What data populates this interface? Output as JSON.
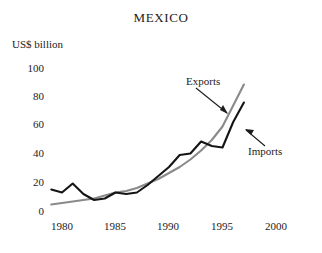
{
  "chart_data": {
    "type": "line",
    "title": "MEXICO",
    "ylabel": "US$ billion",
    "xlabel": "",
    "xlim": [
      1979,
      2001
    ],
    "ylim": [
      0,
      105
    ],
    "grid": false,
    "legend_position": "inline-annotations",
    "yticks": [
      "0",
      "20",
      "40",
      "60",
      "80",
      "100"
    ],
    "ytick_values": [
      0,
      20,
      40,
      60,
      80,
      100
    ],
    "xticks": [
      "1980",
      "1985",
      "1990",
      "1995",
      "2000"
    ],
    "xtick_values": [
      1980,
      1985,
      1990,
      1995,
      2000
    ],
    "series": [
      {
        "name": "Imports",
        "color": "#151515",
        "x": [
          1979,
          1980,
          1981,
          1982,
          1983,
          1984,
          1985,
          1986,
          1987,
          1988,
          1989,
          1990,
          1991,
          1992,
          1993,
          1994,
          1995,
          1996,
          1997
        ],
        "values": [
          15,
          13,
          19,
          12,
          8,
          9,
          13,
          12,
          13,
          18,
          24,
          30,
          38,
          39,
          47,
          44,
          43,
          60,
          73
        ]
      },
      {
        "name": "Exports",
        "color": "#8a8a8a",
        "x": [
          1979,
          1980,
          1981,
          1982,
          1983,
          1984,
          1985,
          1986,
          1987,
          1988,
          1989,
          1990,
          1991,
          1992,
          1993,
          1994,
          1995,
          1996,
          1997
        ],
        "values": [
          5,
          6,
          7,
          8,
          9,
          11,
          13,
          14,
          16,
          19,
          22,
          26,
          30,
          35,
          41,
          48,
          57,
          71,
          85
        ]
      }
    ],
    "annotations": [
      {
        "label": "Exports",
        "target_series": "Exports"
      },
      {
        "label": "Imports",
        "target_series": "Imports"
      }
    ]
  }
}
